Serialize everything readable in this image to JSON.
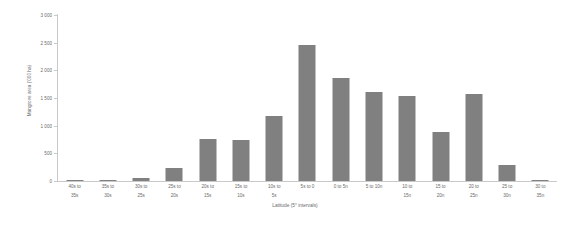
{
  "chart_data": {
    "type": "bar",
    "title": "",
    "xlabel": "Latitude (5° intervals)",
    "ylabel": "Mangrove area ('000 ha)",
    "ylim": [
      0,
      3000
    ],
    "ytick_values": [
      0,
      500,
      1000,
      1500,
      2000,
      2500,
      3000
    ],
    "ytick_labels": [
      "0",
      "500",
      "1 000",
      "1 500",
      "2 000",
      "2 500",
      "3 000"
    ],
    "grid": false,
    "legend": null,
    "bar_color": "#808080",
    "background_color": "#ffffff",
    "axis_color": "#c9c9c9",
    "text_color": "#6a6a6a",
    "categories": [
      "40s to 35s",
      "35s to 30s",
      "30s to 25s",
      "25s to 20s",
      "20s to 15s",
      "15s to 10s",
      "10s to 5s",
      "5s to 0",
      "0 to 5n",
      "5 to 10n",
      "10 to 15n",
      "15 to 20n",
      "20 to 25n",
      "25 to 30n",
      "30 to 35n"
    ],
    "category_lines": [
      [
        "40s to",
        "35s"
      ],
      [
        "35s to",
        "30s"
      ],
      [
        "30s to",
        "25s"
      ],
      [
        "25s to",
        "20s"
      ],
      [
        "20s to",
        "15s"
      ],
      [
        "15s to",
        "10s"
      ],
      [
        "10s to",
        "5s"
      ],
      [
        "5s to 0",
        ""
      ],
      [
        "0 to 5n",
        ""
      ],
      [
        "5 to 10n",
        ""
      ],
      [
        "10 to",
        "15n"
      ],
      [
        "15 to",
        "20n"
      ],
      [
        "20 to",
        "25n"
      ],
      [
        "25 to",
        "30n"
      ],
      [
        "30 to",
        "35n"
      ]
    ],
    "values": [
      10,
      10,
      60,
      240,
      760,
      750,
      1175,
      2460,
      1860,
      1610,
      1540,
      880,
      1570,
      290,
      10
    ]
  }
}
